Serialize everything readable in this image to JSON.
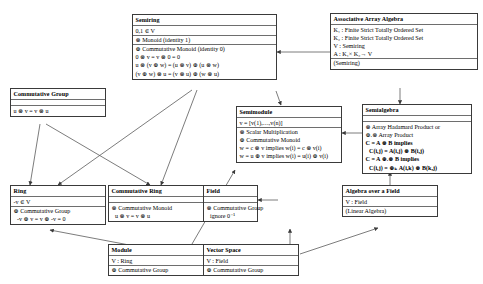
{
  "diagram": {
    "type": "uml-class-inheritance",
    "line_color": "#3a3a3a"
  },
  "nodes": {
    "semiring": {
      "title": "Semiring",
      "rows": [
        "0,1 ∈ V",
        "⊗ Monoid (identity 1)",
        "⊕ Commutative Monoid (identity 0)",
        "0 ⊗ v = v ⊗ 0 = 0",
        "u ⊗ (v ⊕ w) = (u ⊗ v) ⊕ (u ⊗ w)",
        "(v ⊕ w) ⊗ u = (v ⊗ u) ⊕ (w ⊗ u)"
      ]
    },
    "assoc_array_algebra": {
      "title": "Associative Array Algebra",
      "rows": [
        "K₁ : Finite Strict Totally Ordered Set",
        "K₂ : Finite Strict Totally Ordered Set",
        "V : Semiring",
        "A : K₁× K₂→ V",
        "(Semiring)"
      ]
    },
    "commutative_group": {
      "title": "Commutative Group",
      "rows": [
        "u ⊗ v = v ⊗ u"
      ]
    },
    "semimodule": {
      "title": "Semimodule",
      "rows": [
        "v = [v(1),…,v(n)]",
        "⊗ Scalar Multiplication",
        "⊕ Commutative Monoid",
        "w = c ⊗ v implies w(i) = c ⊗ v(i)",
        "w = u ⊕ v implies w(i) = u(i) ⊕ v(i)"
      ]
    },
    "semialgebra": {
      "title": "Semialgebra",
      "rows": [
        "⊗ Array Hadamard Product or",
        "⊕.⊗ Array Product",
        "C = A ⊗ B implies",
        "C(i,j) = A(i,j) ⊗ B(i,j)",
        "C = A ⊕.⊗ B implies",
        "C(i,j) = ⊕ₖ A(i,k) ⊗ B(k,j)"
      ]
    },
    "ring": {
      "title": "Ring",
      "rows": [
        "-v ∈ V",
        "⊕ Commutative Group",
        "-v ⊕ v = v ⊕ -v = 0"
      ]
    },
    "commutative_ring": {
      "title": "Commutative Ring",
      "rows": [
        "⊗ Commutative Monoid",
        "u ⊗ v = v ⊗ u"
      ]
    },
    "field": {
      "title": "Field",
      "rows": [
        "⊗ Commutative Group",
        "ignore 0⁻¹"
      ]
    },
    "algebra_over_field": {
      "title": "Algebra over a Field",
      "rows": [
        "V : Field",
        "(Linear Algebra)"
      ]
    },
    "module": {
      "title": "Module",
      "rows": [
        "V : Ring",
        "⊕ Commutative Group"
      ]
    },
    "vector_space": {
      "title": "Vector Space",
      "rows": [
        "V : Field",
        "⊕ Commutative Group"
      ]
    }
  },
  "edges": [
    {
      "from": "assoc_array_algebra",
      "to": "semiring",
      "label": ""
    },
    {
      "from": "semiring",
      "to": "semimodule",
      "label": ""
    },
    {
      "from": "assoc_array_algebra",
      "to": "semialgebra",
      "label": ""
    },
    {
      "from": "semialgebra",
      "to": "semimodule",
      "label": ""
    },
    {
      "from": "semiring",
      "to": "commutative_ring",
      "label": ""
    },
    {
      "from": "semiring",
      "to": "ring",
      "label": ""
    },
    {
      "from": "commutative_group",
      "to": "ring",
      "label": ""
    },
    {
      "from": "commutative_group",
      "to": "commutative_ring",
      "label": ""
    },
    {
      "from": "commutative_ring",
      "to": "field",
      "label": ""
    },
    {
      "from": "ring",
      "to": "module",
      "label": ""
    },
    {
      "from": "field",
      "to": "vector_space",
      "label": ""
    },
    {
      "from": "module",
      "to": "vector_space",
      "label": ""
    },
    {
      "from": "semimodule",
      "to": "module",
      "label": ""
    },
    {
      "from": "semialgebra",
      "to": "algebra_over_field",
      "label": ""
    },
    {
      "from": "algebra_over_field",
      "to": "vector_space",
      "label": ""
    }
  ]
}
